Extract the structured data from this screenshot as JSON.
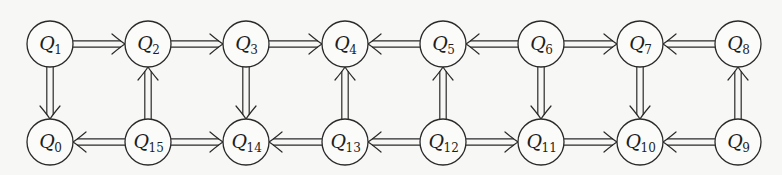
{
  "diagram": {
    "type": "directed-graph",
    "edge_style": "double-line-arrow",
    "colors": {
      "stroke": "#2a2a2a",
      "node_fill": "#fbfbfa",
      "background": "#f7f7f5"
    },
    "node_radius": 23,
    "nodes": [
      {
        "id": "Q1",
        "label": "Q",
        "sub": "1",
        "x": 50,
        "y": 44
      },
      {
        "id": "Q2",
        "label": "Q",
        "sub": "2",
        "x": 148,
        "y": 44
      },
      {
        "id": "Q3",
        "label": "Q",
        "sub": "3",
        "x": 246,
        "y": 44
      },
      {
        "id": "Q4",
        "label": "Q",
        "sub": "4",
        "x": 345,
        "y": 44
      },
      {
        "id": "Q5",
        "label": "Q",
        "sub": "5",
        "x": 443,
        "y": 44
      },
      {
        "id": "Q6",
        "label": "Q",
        "sub": "6",
        "x": 541,
        "y": 44
      },
      {
        "id": "Q7",
        "label": "Q",
        "sub": "7",
        "x": 640,
        "y": 44
      },
      {
        "id": "Q8",
        "label": "Q",
        "sub": "8",
        "x": 738,
        "y": 44
      },
      {
        "id": "Q0",
        "label": "Q",
        "sub": "0",
        "x": 50,
        "y": 142
      },
      {
        "id": "Q15",
        "label": "Q",
        "sub": "15",
        "x": 148,
        "y": 142
      },
      {
        "id": "Q14",
        "label": "Q",
        "sub": "14",
        "x": 246,
        "y": 142
      },
      {
        "id": "Q13",
        "label": "Q",
        "sub": "13",
        "x": 345,
        "y": 142
      },
      {
        "id": "Q12",
        "label": "Q",
        "sub": "12",
        "x": 443,
        "y": 142
      },
      {
        "id": "Q11",
        "label": "Q",
        "sub": "11",
        "x": 541,
        "y": 142
      },
      {
        "id": "Q10",
        "label": "Q",
        "sub": "10",
        "x": 640,
        "y": 142
      },
      {
        "id": "Q9",
        "label": "Q",
        "sub": "9",
        "x": 738,
        "y": 142
      }
    ],
    "edges": [
      {
        "from": "Q1",
        "to": "Q2"
      },
      {
        "from": "Q2",
        "to": "Q3"
      },
      {
        "from": "Q3",
        "to": "Q4"
      },
      {
        "from": "Q5",
        "to": "Q4"
      },
      {
        "from": "Q6",
        "to": "Q5"
      },
      {
        "from": "Q6",
        "to": "Q7"
      },
      {
        "from": "Q8",
        "to": "Q7"
      },
      {
        "from": "Q15",
        "to": "Q0"
      },
      {
        "from": "Q15",
        "to": "Q14"
      },
      {
        "from": "Q13",
        "to": "Q14"
      },
      {
        "from": "Q12",
        "to": "Q13"
      },
      {
        "from": "Q12",
        "to": "Q11"
      },
      {
        "from": "Q11",
        "to": "Q10"
      },
      {
        "from": "Q9",
        "to": "Q10"
      },
      {
        "from": "Q1",
        "to": "Q0"
      },
      {
        "from": "Q15",
        "to": "Q2"
      },
      {
        "from": "Q3",
        "to": "Q14"
      },
      {
        "from": "Q13",
        "to": "Q4"
      },
      {
        "from": "Q12",
        "to": "Q5"
      },
      {
        "from": "Q6",
        "to": "Q11"
      },
      {
        "from": "Q7",
        "to": "Q10"
      },
      {
        "from": "Q9",
        "to": "Q8"
      }
    ]
  }
}
